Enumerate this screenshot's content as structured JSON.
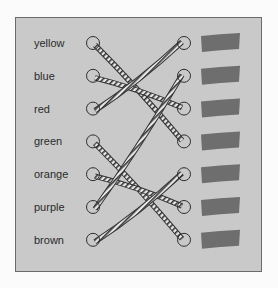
{
  "colors": {
    "panel": "#c9c9c9",
    "swatch": "#6e6e6e",
    "rope": "#3a3a3a",
    "border": "#6a6a6a"
  },
  "labels": [
    "yellow",
    "blue",
    "red",
    "green",
    "orange",
    "purple",
    "brown"
  ],
  "connections": [
    {
      "from": "yellow",
      "to_row": 4
    },
    {
      "from": "blue",
      "to_row": 3
    },
    {
      "from": "red",
      "to_row": 1
    },
    {
      "from": "green",
      "to_row": 7
    },
    {
      "from": "orange",
      "to_row": 6
    },
    {
      "from": "purple",
      "to_row": 2
    },
    {
      "from": "brown",
      "to_row": 5
    }
  ],
  "swatch_count": 7
}
